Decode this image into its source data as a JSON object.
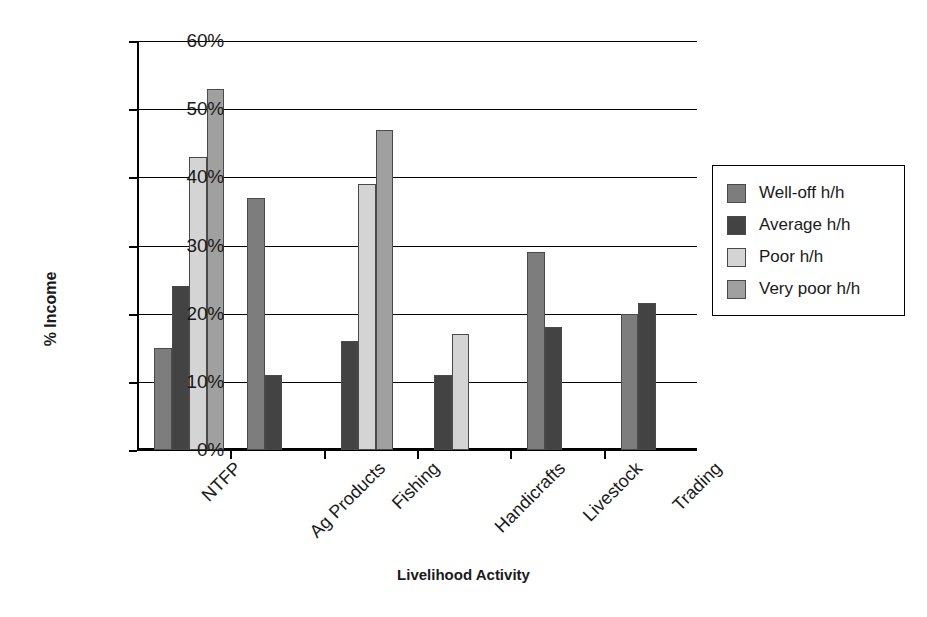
{
  "chart_data": {
    "type": "bar",
    "title": "",
    "xlabel": "Livelihood Activity",
    "ylabel": "% Income",
    "categories": [
      "NTFP",
      "Ag Products",
      "Fishing",
      "Handicrafts",
      "Livestock",
      "Trading"
    ],
    "series": [
      {
        "name": "Well-off h/h",
        "color": "#7d7d7d",
        "values": [
          15,
          37,
          null,
          null,
          29,
          20
        ]
      },
      {
        "name": "Average h/h",
        "color": "#434343",
        "values": [
          24,
          11,
          16,
          11,
          18,
          21.5
        ]
      },
      {
        "name": "Poor h/h",
        "color": "#d4d4d4",
        "values": [
          43,
          null,
          39,
          17,
          null,
          null
        ]
      },
      {
        "name": "Very poor h/h",
        "color": "#a0a0a0",
        "values": [
          53,
          null,
          47,
          null,
          null,
          null
        ]
      }
    ],
    "ylim": [
      0,
      60
    ],
    "ytick_values": [
      0,
      10,
      20,
      30,
      40,
      50,
      60
    ],
    "ytick_labels": [
      "0%",
      "10%",
      "20%",
      "30%",
      "40%",
      "50%",
      "60%"
    ],
    "grid": true,
    "grid_axis": "y",
    "legend_position": "right",
    "legend_entries": [
      "Well-off h/h",
      "Average h/h",
      "Poor h/h",
      "Very poor h/h"
    ],
    "bar_edge_color": "#4a4a4a",
    "axis_color": "#000000",
    "background": "#ffffff"
  }
}
